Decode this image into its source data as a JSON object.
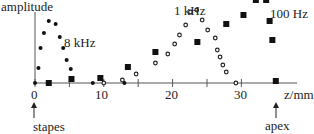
{
  "chart_data": {
    "type": "scatter",
    "title": "",
    "xlabel": "z/mm",
    "ylabel": "amplitude",
    "xlim": [
      0,
      37
    ],
    "ylim": [
      0,
      1
    ],
    "x_ticks": [
      0,
      10,
      20,
      30
    ],
    "x_minor_ticks": [
      5,
      15,
      25
    ],
    "grid": false,
    "annotations": [
      {
        "text": "stapes",
        "x": 0,
        "arrow": "up"
      },
      {
        "text": "apex",
        "x": 35,
        "arrow": "up"
      }
    ],
    "series": [
      {
        "name": "8 kHz",
        "marker": "filled-circle",
        "points": [
          [
            0,
            0
          ],
          [
            0.5,
            0.15
          ],
          [
            0.8,
            0.35
          ],
          [
            1.3,
            0.5
          ],
          [
            2.0,
            0.62
          ],
          [
            3.0,
            0.59
          ],
          [
            3.6,
            0.46
          ],
          [
            4.1,
            0.35
          ],
          [
            4.6,
            0.23
          ],
          [
            5.2,
            0.14
          ],
          [
            8.4,
            0
          ],
          [
            13,
            0
          ]
        ]
      },
      {
        "name": "1 kHz",
        "marker": "open-circle",
        "points": [
          [
            10,
            0
          ],
          [
            12.7,
            0.03
          ],
          [
            14.7,
            0.09
          ],
          [
            17.5,
            0.2
          ],
          [
            19.3,
            0.29
          ],
          [
            20.3,
            0.39
          ],
          [
            21.0,
            0.48
          ],
          [
            21.9,
            0.58
          ],
          [
            22.6,
            0.71
          ],
          [
            23.5,
            0.73
          ],
          [
            24.3,
            0.63
          ],
          [
            25.1,
            0.53
          ],
          [
            26.2,
            0.45
          ],
          [
            26.5,
            0.33
          ],
          [
            26.9,
            0.26
          ],
          [
            27.3,
            0.18
          ],
          [
            27.8,
            0.11
          ],
          [
            29.2,
            0
          ]
        ]
      },
      {
        "name": "100 Hz",
        "marker": "filled-square",
        "points": [
          [
            2,
            0
          ],
          [
            5.3,
            0.04
          ],
          [
            9.5,
            0.05
          ],
          [
            13.5,
            0.16
          ],
          [
            17.5,
            0.31
          ],
          [
            23.6,
            0.41
          ],
          [
            27.8,
            0.59
          ],
          [
            30.3,
            0.68
          ],
          [
            32.1,
            0.83
          ],
          [
            33.6,
            0.83
          ],
          [
            34.1,
            0.62
          ],
          [
            34.5,
            0.43
          ],
          [
            35,
            0.02
          ]
        ]
      }
    ],
    "series_labels": [
      {
        "text": "8 kHz",
        "near_x": 5
      },
      {
        "text": "1 kHz",
        "near_x": 22
      },
      {
        "text": "100 Hz",
        "near_x": 34
      }
    ]
  },
  "labels": {
    "ylabel": "amplitude",
    "xlabel": "z/mm",
    "tick_0": "0",
    "tick_10": "10",
    "tick_20": "20",
    "tick_30": "30",
    "series_8k": "8 kHz",
    "series_1k": "1 kHz",
    "series_100": "100 Hz",
    "stapes": "stapes",
    "apex": "apex"
  }
}
